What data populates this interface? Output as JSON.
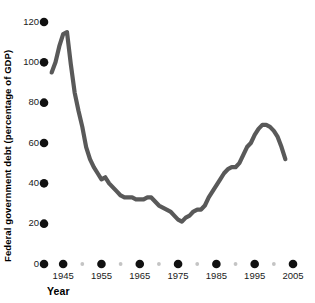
{
  "chart_data": {
    "type": "line",
    "title": "",
    "xlabel": "Year",
    "ylabel": "Federal government debt (percentage of GDP)",
    "xlim": [
      1940,
      2006
    ],
    "ylim": [
      0,
      120
    ],
    "grid": false,
    "legend": "none",
    "line_color": "#595959",
    "tick_color": "#111111",
    "minor_tick_color": "#c4c4c4",
    "x_ticks": [
      1945,
      1955,
      1965,
      1975,
      1985,
      1995,
      2005
    ],
    "x_minor_ticks": [
      1940,
      1950,
      1960,
      1970,
      1980,
      1990,
      2000
    ],
    "y_ticks": [
      0,
      20,
      40,
      60,
      80,
      100,
      120
    ],
    "series": [
      {
        "name": "Federal government debt",
        "x": [
          1942,
          1943,
          1944,
          1945,
          1946,
          1947,
          1948,
          1949,
          1950,
          1951,
          1952,
          1953,
          1954,
          1955,
          1956,
          1957,
          1958,
          1959,
          1960,
          1961,
          1962,
          1963,
          1964,
          1965,
          1966,
          1967,
          1968,
          1969,
          1970,
          1971,
          1972,
          1973,
          1974,
          1975,
          1976,
          1977,
          1978,
          1979,
          1980,
          1981,
          1982,
          1983,
          1984,
          1985,
          1986,
          1987,
          1988,
          1989,
          1990,
          1991,
          1992,
          1993,
          1994,
          1995,
          1996,
          1997,
          1998,
          1999,
          2000,
          2001,
          2002,
          2003
        ],
        "y": [
          95,
          100,
          108,
          114,
          115,
          99,
          85,
          76,
          68,
          58,
          52,
          48,
          45,
          42,
          43,
          40,
          38,
          36,
          34,
          33,
          33,
          33,
          32,
          32,
          32,
          33,
          33,
          31,
          29,
          28,
          27,
          26,
          24,
          22,
          21,
          23,
          24,
          26,
          27,
          27,
          29,
          33,
          36,
          39,
          42,
          45,
          47,
          48,
          48,
          50,
          54,
          58,
          60,
          64,
          67,
          69,
          69,
          68,
          66,
          63,
          58,
          52
        ]
      }
    ]
  }
}
